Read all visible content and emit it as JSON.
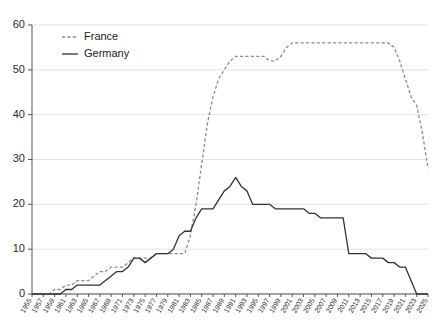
{
  "chart_data": {
    "type": "line",
    "title": "",
    "subtitle": "",
    "xlabel": "",
    "ylabel": "",
    "ylim": [
      0,
      60
    ],
    "xlim": [
      1955,
      2025
    ],
    "grid": true,
    "legend_position": "top-left",
    "yticks": [
      0,
      10,
      20,
      30,
      40,
      50,
      60
    ],
    "ytick_labels": [
      "0",
      "10",
      "20",
      "30",
      "40",
      "50",
      "60"
    ],
    "x": [
      1955,
      1956,
      1957,
      1958,
      1959,
      1960,
      1961,
      1962,
      1963,
      1964,
      1965,
      1966,
      1967,
      1968,
      1969,
      1970,
      1971,
      1972,
      1973,
      1974,
      1975,
      1976,
      1977,
      1978,
      1979,
      1980,
      1981,
      1982,
      1983,
      1984,
      1985,
      1986,
      1987,
      1988,
      1989,
      1990,
      1991,
      1992,
      1993,
      1994,
      1995,
      1996,
      1997,
      1998,
      1999,
      2000,
      2001,
      2002,
      2003,
      2004,
      2005,
      2006,
      2007,
      2008,
      2009,
      2010,
      2011,
      2012,
      2013,
      2014,
      2015,
      2016,
      2017,
      2018,
      2019,
      2020,
      2021,
      2022,
      2023,
      2024,
      2025
    ],
    "xtick_labels": [
      "1955",
      "1957",
      "1959",
      "1961",
      "1963",
      "1965",
      "1967",
      "1969",
      "1971",
      "1973",
      "1975",
      "1977",
      "1979",
      "1981",
      "1983",
      "1985",
      "1987",
      "1989",
      "1991",
      "1993",
      "1995",
      "1997",
      "1999",
      "2001",
      "2003",
      "2005",
      "2007",
      "2009",
      "2011",
      "2013",
      "2015",
      "2017",
      "2019",
      "2021",
      "2023",
      "2025"
    ],
    "xtick_values": [
      1955,
      1957,
      1959,
      1961,
      1963,
      1965,
      1967,
      1969,
      1971,
      1973,
      1975,
      1977,
      1979,
      1981,
      1983,
      1985,
      1987,
      1989,
      1991,
      1993,
      1995,
      1997,
      1999,
      2001,
      2003,
      2005,
      2007,
      2009,
      2011,
      2013,
      2015,
      2017,
      2019,
      2021,
      2023,
      2025
    ],
    "series": [
      {
        "name": "France",
        "style": "dashed",
        "color": "#8c8c8c",
        "values": [
          0,
          0,
          0,
          0,
          1,
          1,
          2,
          2,
          3,
          3,
          3,
          4,
          5,
          5,
          6,
          6,
          6,
          7,
          8,
          8,
          8,
          8,
          9,
          9,
          9,
          9,
          9,
          9,
          13,
          20,
          29,
          38,
          44,
          48,
          50,
          52,
          53,
          53,
          53,
          53,
          53,
          53,
          52,
          52,
          53,
          55,
          56,
          56,
          56,
          56,
          56,
          56,
          56,
          56,
          56,
          56,
          56,
          56,
          56,
          56,
          56,
          56,
          56,
          56,
          55,
          52,
          48,
          44,
          42,
          36,
          28
        ]
      },
      {
        "name": "Germany",
        "style": "solid",
        "color": "#333333",
        "values": [
          0,
          0,
          0,
          0,
          0,
          0,
          1,
          1,
          2,
          2,
          2,
          2,
          2,
          3,
          4,
          5,
          5,
          6,
          8,
          8,
          7,
          8,
          9,
          9,
          9,
          10,
          13,
          14,
          14,
          17,
          19,
          19,
          19,
          21,
          23,
          24,
          26,
          24,
          23,
          20,
          20,
          20,
          20,
          19,
          19,
          19,
          19,
          19,
          19,
          18,
          18,
          17,
          17,
          17,
          17,
          17,
          9,
          9,
          9,
          9,
          8,
          8,
          8,
          7,
          7,
          6,
          6,
          3,
          0,
          0,
          0
        ]
      }
    ]
  },
  "legend": {
    "items": [
      {
        "label": "France",
        "marker": "dashed-line-swatch"
      },
      {
        "label": "Germany",
        "marker": "solid-line-swatch"
      }
    ]
  }
}
